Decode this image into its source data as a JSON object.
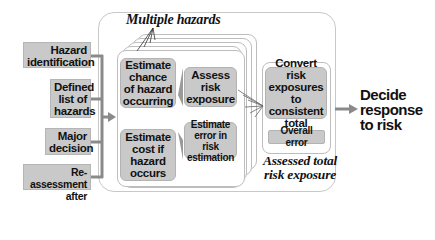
{
  "inputs": {
    "items": [
      {
        "label_lines": [
          "Hazard",
          "identification"
        ]
      },
      {
        "label_lines": [
          "Defined",
          "list of",
          "hazards"
        ]
      },
      {
        "label_lines": [
          "Major",
          "decision"
        ]
      },
      {
        "label_lines": [
          "Re-assessment",
          "after changes"
        ]
      }
    ]
  },
  "hazards_panel": {
    "title": "Multiple hazards",
    "chance_box": [
      "Estimate",
      "chance",
      "of hazard",
      "occurring"
    ],
    "cost_box": [
      "Estimate",
      "cost if",
      "hazard",
      "occurs"
    ],
    "assess_box": [
      "Assess",
      "risk",
      "exposure"
    ],
    "error_box": [
      "Estimate",
      "error in risk",
      "estimation"
    ]
  },
  "total_panel": {
    "convert_box": [
      "Convert risk",
      "exposures to",
      "consistent",
      "total"
    ],
    "overall_error": "Overall error",
    "caption_lines": [
      "Assessed total",
      "risk exposure"
    ]
  },
  "output": {
    "lines": [
      "Decide",
      "response",
      "to risk"
    ]
  },
  "colors": {
    "box_fill": "#c9c9c9",
    "connector": "#8a8a8a",
    "frame": "#c8c8c8"
  }
}
